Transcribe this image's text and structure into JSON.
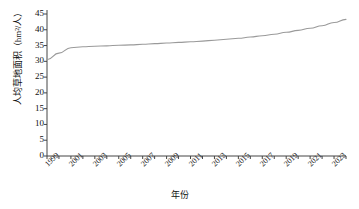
{
  "chart_data": {
    "type": "line",
    "title": "",
    "xlabel": "年份",
    "ylabel": "人均草地面积（hm²/人）",
    "ylim": [
      0,
      45
    ],
    "yticks": [
      0,
      5,
      10,
      15,
      20,
      25,
      30,
      35,
      40,
      45
    ],
    "xlim": [
      1999,
      2024
    ],
    "xticks": [
      1999,
      2000,
      2001,
      2002,
      2003,
      2004,
      2005,
      2006,
      2007,
      2008,
      2009,
      2010,
      2011,
      2012,
      2013,
      2014,
      2015,
      2016,
      2017,
      2018,
      2019,
      2020,
      2021,
      2022,
      2023,
      2024
    ],
    "xtick_labels": [
      "1999",
      "2001",
      "2003",
      "2005",
      "2007",
      "2009",
      "2011",
      "2013",
      "2015",
      "2017",
      "2019",
      "2021",
      "2023"
    ],
    "xtick_label_years": [
      1999,
      2001,
      2003,
      2005,
      2007,
      2009,
      2011,
      2013,
      2015,
      2017,
      2019,
      2021,
      2023
    ],
    "grid": false,
    "legend": "none",
    "line_color": "#9a9a9a",
    "axis_color": "#444444",
    "x": [
      1999,
      2000,
      2001,
      2002,
      2003,
      2004,
      2005,
      2006,
      2007,
      2008,
      2009,
      2010,
      2011,
      2012,
      2013,
      2014,
      2015,
      2016,
      2017,
      2018,
      2019,
      2020,
      2021,
      2022,
      2023,
      2024
    ],
    "values": [
      30.5,
      32.6,
      34.3,
      34.6,
      34.8,
      34.9,
      35.1,
      35.2,
      35.4,
      35.6,
      35.8,
      36.0,
      36.2,
      36.4,
      36.7,
      37.0,
      37.3,
      37.7,
      38.1,
      38.6,
      39.2,
      39.8,
      40.5,
      41.3,
      42.3,
      43.3
    ],
    "series": [
      {
        "name": "人均草地面积",
        "values": [
          30.5,
          32.6,
          34.3,
          34.6,
          34.8,
          34.9,
          35.1,
          35.2,
          35.4,
          35.6,
          35.8,
          36.0,
          36.2,
          36.4,
          36.7,
          37.0,
          37.3,
          37.7,
          38.1,
          38.6,
          39.2,
          39.8,
          40.5,
          41.3,
          42.3,
          43.3
        ]
      }
    ]
  }
}
